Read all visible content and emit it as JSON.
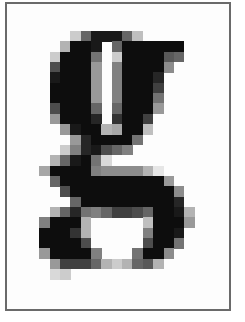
{
  "image": {
    "subject": "pixelated glyph",
    "character": "g",
    "frame_color": "#6a6a6a",
    "ink_color": "#000000",
    "background_color": "#ffffff"
  },
  "grid": {
    "origin_x": 39.3,
    "origin_y": 31,
    "cell_size": 10.35,
    "rows": 24,
    "cols": 16,
    "cells": [
      [
        0,
        3,
        0.2
      ],
      [
        0,
        4,
        0.6
      ],
      [
        0,
        5,
        0.9
      ],
      [
        0,
        6,
        0.9
      ],
      [
        0,
        7,
        0.9
      ],
      [
        0,
        8,
        0.6
      ],
      [
        0,
        9,
        0.25
      ],
      [
        1,
        2,
        0.3
      ],
      [
        1,
        3,
        0.95
      ],
      [
        1,
        4,
        0.95
      ],
      [
        1,
        5,
        0.9
      ],
      [
        1,
        7,
        0.6
      ],
      [
        1,
        8,
        0.95
      ],
      [
        1,
        9,
        0.95
      ],
      [
        1,
        10,
        0.95
      ],
      [
        1,
        11,
        0.95
      ],
      [
        1,
        12,
        0.95
      ],
      [
        1,
        13,
        0.95
      ],
      [
        2,
        1,
        0.2
      ],
      [
        2,
        2,
        0.95
      ],
      [
        2,
        3,
        0.95
      ],
      [
        2,
        4,
        0.95
      ],
      [
        2,
        5,
        0.55
      ],
      [
        2,
        7,
        0.2
      ],
      [
        2,
        8,
        0.95
      ],
      [
        2,
        9,
        0.95
      ],
      [
        2,
        10,
        0.95
      ],
      [
        2,
        11,
        0.95
      ],
      [
        2,
        12,
        0.65
      ],
      [
        2,
        13,
        0.6
      ],
      [
        3,
        1,
        0.7
      ],
      [
        3,
        2,
        0.95
      ],
      [
        3,
        3,
        0.95
      ],
      [
        3,
        4,
        0.95
      ],
      [
        3,
        5,
        0.4
      ],
      [
        3,
        7,
        0.5
      ],
      [
        3,
        8,
        0.95
      ],
      [
        3,
        9,
        0.95
      ],
      [
        3,
        10,
        0.95
      ],
      [
        3,
        11,
        0.95
      ],
      [
        3,
        12,
        0.45
      ],
      [
        4,
        1,
        0.9
      ],
      [
        4,
        2,
        0.95
      ],
      [
        4,
        3,
        0.95
      ],
      [
        4,
        4,
        0.95
      ],
      [
        4,
        5,
        0.4
      ],
      [
        4,
        7,
        0.5
      ],
      [
        4,
        8,
        0.95
      ],
      [
        4,
        9,
        0.95
      ],
      [
        4,
        10,
        0.95
      ],
      [
        4,
        11,
        0.85
      ],
      [
        5,
        1,
        0.95
      ],
      [
        5,
        2,
        0.95
      ],
      [
        5,
        3,
        0.95
      ],
      [
        5,
        4,
        0.95
      ],
      [
        5,
        5,
        0.4
      ],
      [
        5,
        7,
        0.5
      ],
      [
        5,
        8,
        0.95
      ],
      [
        5,
        9,
        0.95
      ],
      [
        5,
        10,
        0.95
      ],
      [
        5,
        11,
        0.75
      ],
      [
        6,
        1,
        0.95
      ],
      [
        6,
        2,
        0.95
      ],
      [
        6,
        3,
        0.95
      ],
      [
        6,
        4,
        0.95
      ],
      [
        6,
        5,
        0.4
      ],
      [
        6,
        7,
        0.5
      ],
      [
        6,
        8,
        0.95
      ],
      [
        6,
        9,
        0.95
      ],
      [
        6,
        10,
        0.95
      ],
      [
        6,
        11,
        0.55
      ],
      [
        7,
        1,
        0.7
      ],
      [
        7,
        2,
        0.95
      ],
      [
        7,
        3,
        0.95
      ],
      [
        7,
        4,
        0.95
      ],
      [
        7,
        5,
        0.6
      ],
      [
        7,
        7,
        0.6
      ],
      [
        7,
        8,
        0.95
      ],
      [
        7,
        9,
        0.95
      ],
      [
        7,
        10,
        0.95
      ],
      [
        7,
        11,
        0.4
      ],
      [
        8,
        1,
        0.4
      ],
      [
        8,
        2,
        0.95
      ],
      [
        8,
        3,
        0.95
      ],
      [
        8,
        4,
        0.95
      ],
      [
        8,
        5,
        0.85
      ],
      [
        8,
        7,
        0.8
      ],
      [
        8,
        8,
        0.95
      ],
      [
        8,
        9,
        0.95
      ],
      [
        8,
        10,
        0.75
      ],
      [
        9,
        2,
        0.4
      ],
      [
        9,
        3,
        0.9
      ],
      [
        9,
        4,
        0.95
      ],
      [
        9,
        5,
        0.95
      ],
      [
        9,
        6,
        0.3
      ],
      [
        9,
        7,
        0.35
      ],
      [
        9,
        8,
        0.95
      ],
      [
        9,
        9,
        0.95
      ],
      [
        9,
        10,
        0.25
      ],
      [
        10,
        3,
        0.4
      ],
      [
        10,
        4,
        0.85
      ],
      [
        10,
        5,
        0.95
      ],
      [
        10,
        6,
        0.95
      ],
      [
        10,
        7,
        0.95
      ],
      [
        10,
        8,
        0.95
      ],
      [
        10,
        9,
        0.55
      ],
      [
        11,
        2,
        0.2
      ],
      [
        11,
        3,
        0.5
      ],
      [
        11,
        4,
        0.85
      ],
      [
        11,
        5,
        0.9
      ],
      [
        11,
        6,
        0.7
      ],
      [
        11,
        7,
        0.6
      ],
      [
        11,
        8,
        0.5
      ],
      [
        12,
        1,
        0.3
      ],
      [
        12,
        2,
        0.6
      ],
      [
        12,
        3,
        0.9
      ],
      [
        12,
        4,
        0.95
      ],
      [
        12,
        5,
        0.55
      ],
      [
        12,
        6,
        0.15
      ],
      [
        13,
        0,
        0.35
      ],
      [
        13,
        1,
        0.95
      ],
      [
        13,
        2,
        0.95
      ],
      [
        13,
        3,
        0.95
      ],
      [
        13,
        4,
        0.95
      ],
      [
        13,
        5,
        0.5
      ],
      [
        13,
        6,
        0.45
      ],
      [
        13,
        7,
        0.45
      ],
      [
        13,
        8,
        0.45
      ],
      [
        13,
        9,
        0.45
      ],
      [
        13,
        10,
        0.3
      ],
      [
        13,
        11,
        0.1
      ],
      [
        14,
        1,
        0.6
      ],
      [
        14,
        2,
        0.95
      ],
      [
        14,
        3,
        0.95
      ],
      [
        14,
        4,
        0.95
      ],
      [
        14,
        5,
        0.95
      ],
      [
        14,
        6,
        0.95
      ],
      [
        14,
        7,
        0.95
      ],
      [
        14,
        8,
        0.95
      ],
      [
        14,
        9,
        0.95
      ],
      [
        14,
        10,
        0.95
      ],
      [
        14,
        11,
        0.95
      ],
      [
        14,
        12,
        0.4
      ],
      [
        15,
        2,
        0.7
      ],
      [
        15,
        3,
        0.95
      ],
      [
        15,
        4,
        0.95
      ],
      [
        15,
        5,
        0.95
      ],
      [
        15,
        6,
        0.95
      ],
      [
        15,
        7,
        0.95
      ],
      [
        15,
        8,
        0.95
      ],
      [
        15,
        9,
        0.95
      ],
      [
        15,
        10,
        0.95
      ],
      [
        15,
        11,
        0.95
      ],
      [
        15,
        12,
        0.95
      ],
      [
        15,
        13,
        0.45
      ],
      [
        16,
        3,
        0.6
      ],
      [
        16,
        4,
        0.95
      ],
      [
        16,
        5,
        0.95
      ],
      [
        16,
        6,
        0.95
      ],
      [
        16,
        7,
        0.95
      ],
      [
        16,
        8,
        0.95
      ],
      [
        16,
        9,
        0.95
      ],
      [
        16,
        10,
        0.95
      ],
      [
        16,
        11,
        0.95
      ],
      [
        16,
        12,
        0.95
      ],
      [
        16,
        13,
        0.85
      ],
      [
        17,
        1,
        0.3
      ],
      [
        17,
        2,
        0.6
      ],
      [
        17,
        3,
        0.85
      ],
      [
        17,
        4,
        0.55
      ],
      [
        17,
        5,
        0.5
      ],
      [
        17,
        6,
        0.6
      ],
      [
        17,
        7,
        0.75
      ],
      [
        17,
        8,
        0.75
      ],
      [
        17,
        9,
        0.7
      ],
      [
        17,
        10,
        0.6
      ],
      [
        17,
        11,
        0.95
      ],
      [
        17,
        12,
        0.95
      ],
      [
        17,
        13,
        0.9
      ],
      [
        17,
        14,
        0.3
      ],
      [
        18,
        0,
        0.5
      ],
      [
        18,
        1,
        0.95
      ],
      [
        18,
        2,
        0.95
      ],
      [
        18,
        3,
        0.95
      ],
      [
        18,
        4,
        0.3
      ],
      [
        18,
        10,
        0.25
      ],
      [
        18,
        11,
        0.95
      ],
      [
        18,
        12,
        0.95
      ],
      [
        18,
        13,
        0.95
      ],
      [
        18,
        14,
        0.4
      ],
      [
        19,
        0,
        0.95
      ],
      [
        19,
        1,
        0.95
      ],
      [
        19,
        2,
        0.95
      ],
      [
        19,
        3,
        0.8
      ],
      [
        19,
        4,
        0.3
      ],
      [
        19,
        10,
        0.5
      ],
      [
        19,
        11,
        0.95
      ],
      [
        19,
        12,
        0.95
      ],
      [
        19,
        13,
        0.9
      ],
      [
        20,
        0,
        0.95
      ],
      [
        20,
        1,
        0.95
      ],
      [
        20,
        2,
        0.95
      ],
      [
        20,
        3,
        0.95
      ],
      [
        20,
        4,
        0.7
      ],
      [
        20,
        10,
        0.7
      ],
      [
        20,
        11,
        0.95
      ],
      [
        20,
        12,
        0.95
      ],
      [
        20,
        13,
        0.55
      ],
      [
        21,
        0,
        0.4
      ],
      [
        21,
        1,
        0.95
      ],
      [
        21,
        2,
        0.95
      ],
      [
        21,
        3,
        0.95
      ],
      [
        21,
        4,
        0.95
      ],
      [
        21,
        5,
        0.5
      ],
      [
        21,
        9,
        0.55
      ],
      [
        21,
        10,
        0.95
      ],
      [
        21,
        11,
        0.95
      ],
      [
        21,
        12,
        0.45
      ],
      [
        22,
        1,
        0.4
      ],
      [
        22,
        2,
        0.75
      ],
      [
        22,
        3,
        0.75
      ],
      [
        22,
        4,
        0.75
      ],
      [
        22,
        5,
        0.6
      ],
      [
        22,
        6,
        0.3
      ],
      [
        22,
        7,
        0.2
      ],
      [
        22,
        8,
        0.3
      ],
      [
        22,
        9,
        0.6
      ],
      [
        22,
        10,
        0.65
      ],
      [
        22,
        11,
        0.3
      ],
      [
        23,
        1,
        0.15
      ],
      [
        23,
        2,
        0.2
      ]
    ]
  }
}
